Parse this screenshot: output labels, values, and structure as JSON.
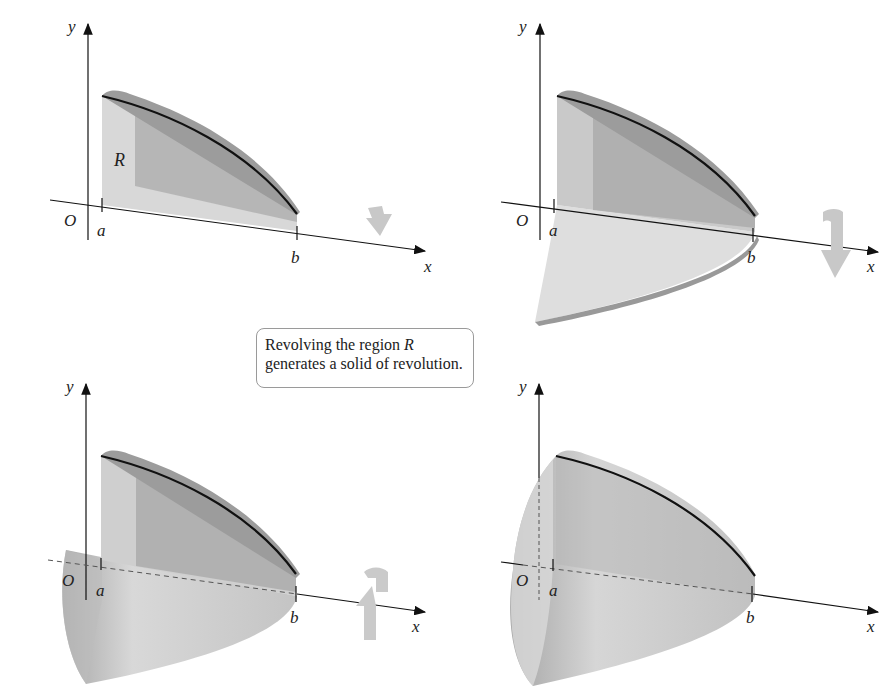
{
  "figure": {
    "caption": {
      "line1_prefix": "Revolving the region ",
      "line1_var": "R",
      "line2": "generates a solid of revolution."
    },
    "panels": [
      {
        "id": "panel-1",
        "stage": "region R in the plane",
        "labels": {
          "y": "y",
          "x": "x",
          "origin": "O",
          "a": "a",
          "b": "b",
          "region": "R"
        },
        "rotation_arrow": "arrow-down-icon"
      },
      {
        "id": "panel-2",
        "stage": "region partially revolved",
        "labels": {
          "y": "y",
          "x": "x",
          "origin": "O",
          "a": "a",
          "b": "b"
        },
        "rotation_arrow": "curved-arrow-down-icon"
      },
      {
        "id": "panel-3",
        "stage": "region revolved further",
        "labels": {
          "y": "y",
          "x": "x",
          "origin": "O",
          "a": "a",
          "b": "b"
        },
        "rotation_arrow": "rotate-around-axis-icon"
      },
      {
        "id": "panel-4",
        "stage": "complete solid of revolution",
        "labels": {
          "y": "y",
          "x": "x",
          "origin": "O",
          "a": "a",
          "b": "b"
        }
      }
    ],
    "colors": {
      "axis": "#111111",
      "curve": "#111111",
      "region_light": "#d6d6d6",
      "region_dark": "#a9a9a9",
      "rim": "#8e8e8e",
      "arrow": "#c4c4c4",
      "callout_border": "#9a9a9a"
    }
  }
}
